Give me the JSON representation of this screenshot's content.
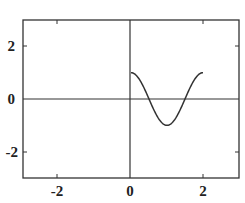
{
  "chart_data": {
    "type": "line",
    "title": "",
    "xlabel": "",
    "ylabel": "",
    "xlim": [
      -3,
      3
    ],
    "ylim": [
      -3,
      3
    ],
    "grid": false,
    "legend": null,
    "xticks": [
      -2,
      0,
      2
    ],
    "yticks": [
      -2,
      0,
      2
    ],
    "xtick_labels": [
      "-2",
      "0",
      "2"
    ],
    "ytick_labels": [
      "2",
      "0",
      "-2"
    ],
    "axes_lines": {
      "x_zero": true,
      "y_zero": true
    },
    "series": [
      {
        "name": "cos(pi x)",
        "function": "cos(pi*x)",
        "domain": [
          0,
          2
        ],
        "x": [
          0,
          0.25,
          0.5,
          0.75,
          1.0,
          1.25,
          1.5,
          1.75,
          2.0
        ],
        "y": [
          1.0,
          0.71,
          0.0,
          -0.71,
          -1.0,
          -0.71,
          0.0,
          0.71,
          1.0
        ],
        "color": "#333333"
      }
    ]
  },
  "labels": {
    "x_tick_neg2": "-2",
    "x_tick_0": "0",
    "x_tick_2": "2",
    "y_tick_2": "2",
    "y_tick_0": "0",
    "y_tick_neg2": "-2"
  }
}
